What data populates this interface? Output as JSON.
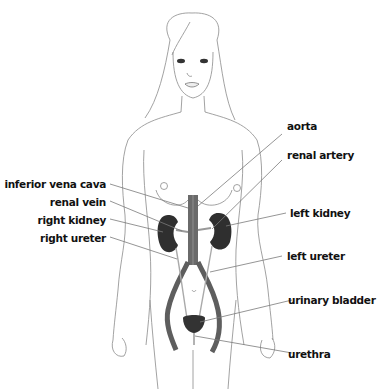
{
  "diagram": {
    "type": "anatomical-illustration",
    "colors": {
      "outline": "#888888",
      "organ": "#3a3a3a",
      "vessel": "#5a5a5a",
      "leader": "#777777",
      "text": "#111111"
    },
    "labels_left": [
      {
        "id": "inferior-vena-cava",
        "text": "inferior vena cava"
      },
      {
        "id": "renal-vein",
        "text": "renal vein"
      },
      {
        "id": "right-kidney",
        "text": "right kidney"
      },
      {
        "id": "right-ureter",
        "text": "right ureter"
      }
    ],
    "labels_right": [
      {
        "id": "aorta",
        "text": "aorta"
      },
      {
        "id": "renal-artery",
        "text": "renal artery"
      },
      {
        "id": "left-kidney",
        "text": "left kidney"
      },
      {
        "id": "left-ureter",
        "text": "left ureter"
      },
      {
        "id": "urinary-bladder",
        "text": "urinary bladder"
      },
      {
        "id": "urethra",
        "text": "urethra"
      }
    ]
  }
}
